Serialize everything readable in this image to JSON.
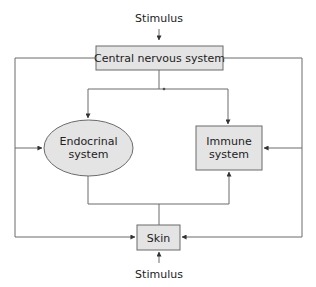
{
  "diagram": {
    "type": "flow",
    "nodes": {
      "stimulus_top": {
        "label": "Stimulus"
      },
      "cns": {
        "label": "Central nervous system",
        "shape": "rectangle"
      },
      "endocrine": {
        "label_line1": "Endocrinal",
        "label_line2": "system",
        "shape": "ellipse"
      },
      "immune": {
        "label_line1": "Immune",
        "label_line2": "system",
        "shape": "rectangle"
      },
      "skin": {
        "label": "Skin",
        "shape": "rectangle"
      },
      "stimulus_bottom": {
        "label": "Stimulus"
      }
    },
    "edges": [
      {
        "from": "Stimulus",
        "to": "Central nervous system"
      },
      {
        "from": "Central nervous system",
        "to": "Endocrinal system"
      },
      {
        "from": "Central nervous system",
        "to": "Immune system"
      },
      {
        "from": "Central nervous system",
        "to": "Endocrinal system",
        "via": "left loop"
      },
      {
        "from": "Central nervous system",
        "to": "Immune system",
        "via": "right loop"
      },
      {
        "from": "Central nervous system",
        "to": "Skin",
        "via": "left loop"
      },
      {
        "from": "Central nervous system",
        "to": "Skin",
        "via": "right loop"
      },
      {
        "from": "Skin",
        "to": "Endocrinal system"
      },
      {
        "from": "Skin",
        "to": "Immune system"
      },
      {
        "from": "Stimulus",
        "to": "Skin"
      }
    ],
    "colors": {
      "node_fill": "#e4e4e4",
      "line": "#6a6a6a",
      "text": "#222222"
    }
  }
}
